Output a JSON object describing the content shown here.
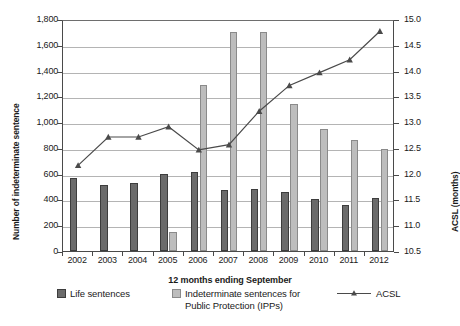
{
  "chart_data": {
    "type": "bar",
    "title": "",
    "xlabel": "12 months ending September",
    "ylabel": "Number of indeterminate sentence",
    "y2label": "ACSL (months)",
    "categories": [
      "2002",
      "2003",
      "2004",
      "2005",
      "2006",
      "2007",
      "2008",
      "2009",
      "2010",
      "2011",
      "2012"
    ],
    "ylim": [
      0,
      1800
    ],
    "y2lim": [
      10.5,
      15.0
    ],
    "yticks": [
      "0",
      "200",
      "400",
      "600",
      "800",
      "1,000",
      "1,200",
      "1,400",
      "1,600",
      "1,800"
    ],
    "ytick_values": [
      0,
      200,
      400,
      600,
      800,
      1000,
      1200,
      1400,
      1600,
      1800
    ],
    "y2ticks": [
      "10.5",
      "11.0",
      "11.5",
      "12.0",
      "12.5",
      "13.0",
      "13.5",
      "14.0",
      "14.5",
      "15.0"
    ],
    "y2tick_values": [
      10.5,
      11.0,
      11.5,
      12.0,
      12.5,
      13.0,
      13.5,
      14.0,
      14.5,
      15.0
    ],
    "grid": true,
    "legend_position": "bottom",
    "series": [
      {
        "name": "Life sentences",
        "type": "bar",
        "axis": "left",
        "color": "#6b6b6b",
        "values": [
          570,
          510,
          525,
          600,
          615,
          475,
          480,
          455,
          400,
          355,
          415
        ]
      },
      {
        "name": "Indeterminate sentences for Public Protection (IPPs)",
        "type": "bar",
        "axis": "left",
        "color": "#bdbdbd",
        "values": [
          0,
          0,
          0,
          145,
          1290,
          1700,
          1700,
          1140,
          950,
          860,
          790
        ]
      },
      {
        "name": "ACSL",
        "type": "line",
        "axis": "right",
        "color": "#4a4a4a",
        "marker": "triangle",
        "values": [
          12.2,
          12.75,
          12.75,
          12.95,
          12.5,
          12.6,
          13.25,
          13.75,
          14.0,
          14.25,
          14.8
        ]
      }
    ]
  },
  "legend": {
    "life_label": "Life sentences",
    "ipp_label_line1": "Indeterminate sentences for",
    "ipp_label_line2": "Public Protection (IPPs)",
    "acsl_label": "ACSL"
  },
  "colors": {
    "life": "#6b6b6b",
    "ipp": "#bdbdbd",
    "acsl": "#4a4a4a",
    "grid": "#b4b4b4",
    "axis": "#4a4a4a"
  }
}
